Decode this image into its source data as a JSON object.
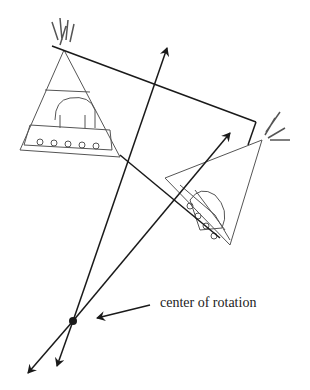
{
  "diagram": {
    "label": "center of rotation",
    "colors": {
      "line": "#1a1a1a",
      "sketch": "#555555",
      "background": "#ffffff"
    },
    "center": {
      "x": 73,
      "y": 321
    },
    "objects": [
      "teepee-original",
      "teepee-rotated"
    ]
  }
}
